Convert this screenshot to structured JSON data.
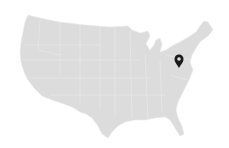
{
  "map": {
    "region": "Contiguous United States",
    "land_color": "#dcdcdc",
    "border_color": "#ececec",
    "background": "#ffffff"
  },
  "marker": {
    "icon": "map-pin-icon",
    "color": "#1a1a1a",
    "x": 179,
    "y": 68
  }
}
